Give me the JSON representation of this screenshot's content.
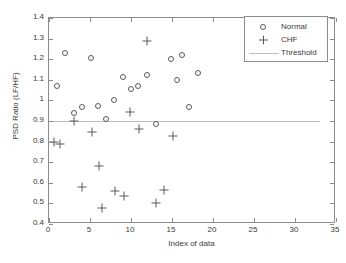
{
  "chart_data": {
    "type": "scatter",
    "title": "",
    "xlabel": "Index of data",
    "ylabel": "PSD Ratio (LF/HF)",
    "xlim": [
      0,
      35
    ],
    "ylim": [
      0.4,
      1.4
    ],
    "xticks": [
      0,
      5,
      10,
      15,
      20,
      25,
      30,
      35
    ],
    "xtick_labels": [
      "0",
      "5",
      "10",
      "15",
      "20",
      "25",
      "30",
      "35"
    ],
    "yticks": [
      0.4,
      0.5,
      0.6,
      0.7,
      0.8,
      0.9,
      1.0,
      1.1,
      1.2,
      1.3,
      1.4
    ],
    "ytick_labels": [
      "0.4",
      "0.5",
      "0.6",
      "0.7",
      "0.8",
      "0.9",
      "1",
      "1.1",
      "1.2",
      "1.3",
      "1.4"
    ],
    "grid": false,
    "legend_position": "upper right",
    "marker_color": "#5a5a5a",
    "threshold_color": "#c0c0c0",
    "axis_color": "#8c8c8c",
    "series": [
      {
        "name": "Normal",
        "marker": "circle",
        "points": [
          [
            1,
            1.07
          ],
          [
            2,
            1.23
          ],
          [
            3,
            0.94
          ],
          [
            4,
            0.97
          ],
          [
            5.1,
            1.205
          ],
          [
            6,
            0.975
          ],
          [
            7,
            0.91
          ],
          [
            7.9,
            1.0
          ],
          [
            9,
            1.115
          ],
          [
            10,
            1.055
          ],
          [
            10.9,
            1.07
          ],
          [
            12,
            1.125
          ],
          [
            13.1,
            0.885
          ],
          [
            14.9,
            1.2
          ],
          [
            15.6,
            1.1
          ],
          [
            16.2,
            1.22
          ],
          [
            17.1,
            0.97
          ],
          [
            18.2,
            1.135
          ]
        ]
      },
      {
        "name": "CHF",
        "marker": "plus",
        "points": [
          [
            0.6,
            0.8
          ],
          [
            1.3,
            0.79
          ],
          [
            3.0,
            0.9
          ],
          [
            4.0,
            0.58
          ],
          [
            5.2,
            0.845
          ],
          [
            6.1,
            0.68
          ],
          [
            6.5,
            0.48
          ],
          [
            8.1,
            0.56
          ],
          [
            9.1,
            0.535
          ],
          [
            9.9,
            0.945
          ],
          [
            11.0,
            0.86
          ],
          [
            12.0,
            1.29
          ],
          [
            13.1,
            0.5
          ],
          [
            14.0,
            0.565
          ],
          [
            15.1,
            0.825
          ]
        ]
      }
    ],
    "threshold": {
      "name": "Threshold",
      "value": 0.9,
      "x_start": 0,
      "x_end": 33
    }
  },
  "legend": {
    "entries": [
      {
        "label": "Normal",
        "symbol": "circle-marker"
      },
      {
        "label": "CHF",
        "symbol": "plus-marker"
      },
      {
        "label": "Threshold",
        "symbol": "line-marker"
      }
    ]
  }
}
